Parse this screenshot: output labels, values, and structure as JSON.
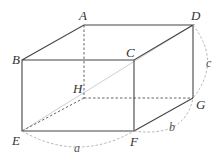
{
  "diagram": {
    "type": "rectangular-prism",
    "vertices": {
      "A": {
        "label": "A",
        "x": 84,
        "y": 25
      },
      "B": {
        "label": "B",
        "x": 22,
        "y": 60
      },
      "C": {
        "label": "C",
        "x": 134,
        "y": 60
      },
      "D": {
        "label": "D",
        "x": 193,
        "y": 25
      },
      "E": {
        "label": "E",
        "x": 22,
        "y": 131
      },
      "F": {
        "label": "F",
        "x": 134,
        "y": 131
      },
      "G": {
        "label": "G",
        "x": 193,
        "y": 98
      },
      "H": {
        "label": "H",
        "x": 84,
        "y": 98
      }
    },
    "dimensions": {
      "a": "a",
      "b": "b",
      "c": "c"
    },
    "diagonal": "ED",
    "colors": {
      "edge": "#444444",
      "hidden": "#555555",
      "diagonal": "#c8c8c8",
      "arc": "#999999"
    }
  }
}
